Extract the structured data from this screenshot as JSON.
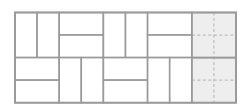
{
  "diagram": {
    "title": "",
    "origin": {
      "x": 15,
      "y": 12.5
    },
    "unit": {
      "w": 22.1,
      "h": 22.55
    },
    "grid": {
      "cols": 10,
      "rows": 4
    },
    "colors": {
      "background": "#ffffff",
      "line": "#9a9a9a",
      "shaded": "#eeeeee",
      "dashed": "#bdbdbd"
    },
    "dominoes": [
      {
        "id": "d1",
        "col": 0,
        "row": 0,
        "w": 1,
        "h": 2,
        "orientation": "vertical"
      },
      {
        "id": "d2",
        "col": 1,
        "row": 0,
        "w": 1,
        "h": 2,
        "orientation": "vertical"
      },
      {
        "id": "d3",
        "col": 2,
        "row": 0,
        "w": 2,
        "h": 1,
        "orientation": "horizontal"
      },
      {
        "id": "d4",
        "col": 2,
        "row": 1,
        "w": 2,
        "h": 1,
        "orientation": "horizontal"
      },
      {
        "id": "d5",
        "col": 4,
        "row": 0,
        "w": 1,
        "h": 2,
        "orientation": "vertical"
      },
      {
        "id": "d6",
        "col": 5,
        "row": 0,
        "w": 1,
        "h": 2,
        "orientation": "vertical"
      },
      {
        "id": "d7",
        "col": 6,
        "row": 0,
        "w": 2,
        "h": 1,
        "orientation": "horizontal"
      },
      {
        "id": "d8",
        "col": 6,
        "row": 1,
        "w": 2,
        "h": 1,
        "orientation": "horizontal"
      },
      {
        "id": "d9",
        "col": 0,
        "row": 2,
        "w": 2,
        "h": 1,
        "orientation": "horizontal"
      },
      {
        "id": "d10",
        "col": 0,
        "row": 3,
        "w": 2,
        "h": 1,
        "orientation": "horizontal"
      },
      {
        "id": "d11",
        "col": 2,
        "row": 2,
        "w": 1,
        "h": 2,
        "orientation": "vertical"
      },
      {
        "id": "d12",
        "col": 3,
        "row": 2,
        "w": 1,
        "h": 2,
        "orientation": "vertical"
      },
      {
        "id": "d13",
        "col": 4,
        "row": 2,
        "w": 2,
        "h": 1,
        "orientation": "horizontal"
      },
      {
        "id": "d14",
        "col": 4,
        "row": 3,
        "w": 2,
        "h": 1,
        "orientation": "horizontal"
      },
      {
        "id": "d15",
        "col": 6,
        "row": 2,
        "w": 1,
        "h": 2,
        "orientation": "vertical"
      },
      {
        "id": "d16",
        "col": 7,
        "row": 2,
        "w": 1,
        "h": 2,
        "orientation": "vertical"
      }
    ],
    "shaded_region": {
      "col": 8,
      "row": 0,
      "w": 2,
      "h": 4,
      "blocks": [
        {
          "col": 8,
          "row": 0,
          "w": 2,
          "h": 2
        },
        {
          "col": 8,
          "row": 2,
          "w": 2,
          "h": 2
        }
      ]
    }
  }
}
